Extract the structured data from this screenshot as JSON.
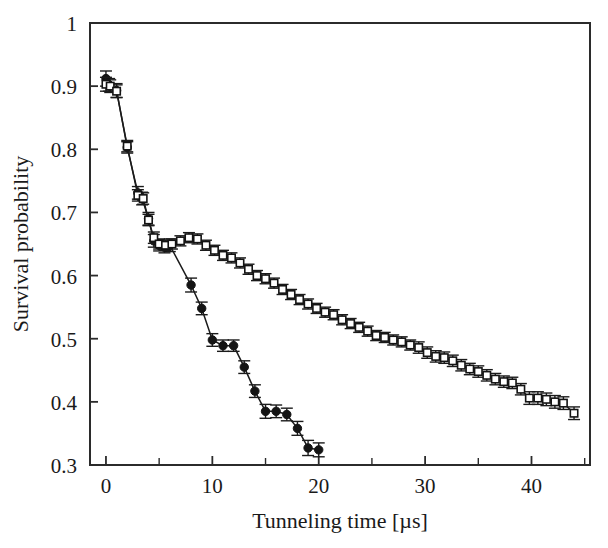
{
  "chart_data": {
    "type": "line",
    "title": "",
    "xlabel": "Tunneling time [µs]",
    "ylabel": "Survival probability",
    "xlim": [
      -1.5,
      45.5
    ],
    "ylim": [
      0.3,
      1.0
    ],
    "xticks": [
      0,
      10,
      20,
      30,
      40
    ],
    "xticklabels": [
      "0",
      "10",
      "20",
      "30",
      "40"
    ],
    "xminor_ticks": [
      5,
      15,
      25,
      35,
      45
    ],
    "yticks": [
      0.3,
      0.4,
      0.5,
      0.6,
      0.7,
      0.8,
      0.9,
      1.0
    ],
    "yticklabels": [
      "0.3",
      "0.4",
      "0.5",
      "0.6",
      "0.7",
      "0.8",
      "0.9",
      "1"
    ],
    "grid": false,
    "legend": "none",
    "frame": "box",
    "series": [
      {
        "name": "filled-circles",
        "marker": "filled-circle",
        "color": "#141414",
        "x": [
          0.0,
          0.3,
          1.0,
          2.0,
          3.0,
          3.4,
          4.0,
          4.5,
          5.0,
          5.5,
          6.0,
          8.0,
          9.0,
          10.0,
          11.0,
          12.0,
          13.0,
          14.0,
          15.0,
          16.0,
          17.0,
          18.0,
          19.0,
          20.0
        ],
        "y": [
          0.912,
          0.902,
          0.893,
          0.803,
          0.731,
          0.722,
          0.69,
          0.655,
          0.648,
          0.645,
          0.648,
          0.585,
          0.548,
          0.498,
          0.489,
          0.489,
          0.455,
          0.417,
          0.385,
          0.385,
          0.38,
          0.358,
          0.327,
          0.324
        ],
        "yerr": [
          0.012,
          0.01,
          0.011,
          0.009,
          0.01,
          0.01,
          0.01,
          0.01,
          0.009,
          0.009,
          0.01,
          0.011,
          0.01,
          0.01,
          0.009,
          0.009,
          0.01,
          0.01,
          0.011,
          0.01,
          0.01,
          0.011,
          0.012,
          0.011
        ]
      },
      {
        "name": "open-squares",
        "marker": "open-square",
        "color": "#141414",
        "x": [
          0.0,
          0.4,
          1.0,
          2.0,
          3.0,
          3.5,
          4.0,
          4.5,
          5.0,
          5.6,
          6.2,
          7.0,
          7.8,
          8.6,
          9.4,
          10.2,
          11.0,
          11.8,
          12.6,
          13.4,
          14.2,
          15.0,
          15.8,
          16.6,
          17.4,
          18.2,
          19.0,
          19.8,
          20.6,
          21.4,
          22.2,
          23.0,
          23.8,
          24.6,
          25.4,
          26.2,
          27.0,
          27.8,
          28.6,
          29.4,
          30.2,
          31.0,
          31.8,
          32.6,
          33.4,
          34.2,
          35.0,
          35.8,
          36.6,
          37.4,
          38.2,
          39.0,
          39.8,
          40.6,
          41.4,
          42.2,
          43.0,
          44.0
        ],
        "y": [
          0.903,
          0.9,
          0.892,
          0.805,
          0.727,
          0.722,
          0.688,
          0.66,
          0.65,
          0.648,
          0.65,
          0.655,
          0.66,
          0.658,
          0.648,
          0.64,
          0.632,
          0.628,
          0.62,
          0.61,
          0.6,
          0.595,
          0.588,
          0.578,
          0.57,
          0.562,
          0.555,
          0.548,
          0.542,
          0.538,
          0.53,
          0.524,
          0.518,
          0.512,
          0.505,
          0.502,
          0.498,
          0.495,
          0.49,
          0.486,
          0.478,
          0.472,
          0.47,
          0.465,
          0.458,
          0.452,
          0.448,
          0.442,
          0.436,
          0.432,
          0.43,
          0.42,
          0.406,
          0.406,
          0.404,
          0.4,
          0.398,
          0.382
        ],
        "yerr": [
          0.011,
          0.01,
          0.01,
          0.009,
          0.009,
          0.009,
          0.009,
          0.009,
          0.008,
          0.008,
          0.008,
          0.008,
          0.008,
          0.008,
          0.008,
          0.008,
          0.008,
          0.008,
          0.008,
          0.008,
          0.008,
          0.008,
          0.008,
          0.008,
          0.008,
          0.008,
          0.008,
          0.008,
          0.008,
          0.008,
          0.008,
          0.008,
          0.008,
          0.008,
          0.008,
          0.008,
          0.008,
          0.008,
          0.008,
          0.009,
          0.009,
          0.009,
          0.009,
          0.009,
          0.009,
          0.009,
          0.009,
          0.009,
          0.009,
          0.009,
          0.009,
          0.009,
          0.01,
          0.01,
          0.01,
          0.01,
          0.01,
          0.01
        ]
      }
    ]
  }
}
